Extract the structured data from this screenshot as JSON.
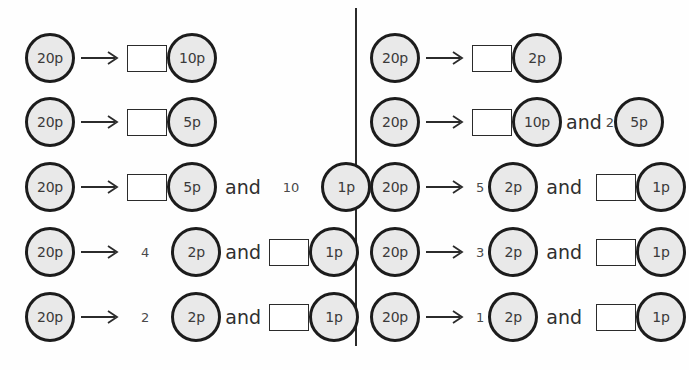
{
  "worksheet": {
    "coin_labels": {
      "twenty": "20p",
      "ten": "10p",
      "five": "5p",
      "two": "2p",
      "one": "1p"
    },
    "conjunction": "and",
    "arrow_icon": "right-arrow-icon",
    "colors": {
      "coin_fill": "#e9e9e9",
      "coin_ring": "#1c1c1c",
      "box_border": "#2b2b2b",
      "text": "#2f2f2f",
      "divider": "#2b2b2b",
      "page_background": "#fefefe"
    },
    "left_column": {
      "rows": [
        {
          "start_coin": "20p",
          "answer_box_position": "before-coin-1",
          "coin_1": "10p",
          "count_1": "",
          "conjunction": "",
          "coin_2": "",
          "count_2": ""
        },
        {
          "start_coin": "20p",
          "answer_box_position": "before-coin-1",
          "coin_1": "5p",
          "count_1": "",
          "conjunction": "",
          "coin_2": "",
          "count_2": ""
        },
        {
          "start_coin": "20p",
          "answer_box_position": "before-coin-1",
          "coin_1": "5p",
          "count_1": "",
          "conjunction": "and",
          "coin_2": "1p",
          "count_2": "10"
        },
        {
          "start_coin": "20p",
          "answer_box_position": "before-coin-2",
          "coin_1": "2p",
          "count_1": "4",
          "conjunction": "and",
          "coin_2": "1p",
          "count_2": ""
        },
        {
          "start_coin": "20p",
          "answer_box_position": "before-coin-2",
          "coin_1": "2p",
          "count_1": "2",
          "conjunction": "and",
          "coin_2": "1p",
          "count_2": ""
        }
      ]
    },
    "right_column": {
      "rows": [
        {
          "start_coin": "20p",
          "answer_box_position": "before-coin-1",
          "coin_1": "2p",
          "count_1": "",
          "conjunction": "",
          "coin_2": "",
          "count_2": ""
        },
        {
          "start_coin": "20p",
          "answer_box_position": "before-coin-1",
          "coin_1": "10p",
          "count_1": "",
          "conjunction": "and",
          "coin_2": "5p",
          "count_2": "2"
        },
        {
          "start_coin": "20p",
          "answer_box_position": "before-coin-2",
          "coin_1": "2p",
          "count_1": "5",
          "conjunction": "and",
          "coin_2": "1p",
          "count_2": ""
        },
        {
          "start_coin": "20p",
          "answer_box_position": "before-coin-2",
          "coin_1": "2p",
          "count_1": "3",
          "conjunction": "and",
          "coin_2": "1p",
          "count_2": ""
        },
        {
          "start_coin": "20p",
          "answer_box_position": "before-coin-2",
          "coin_1": "2p",
          "count_1": "1",
          "conjunction": "and",
          "coin_2": "1p",
          "count_2": ""
        }
      ]
    }
  }
}
